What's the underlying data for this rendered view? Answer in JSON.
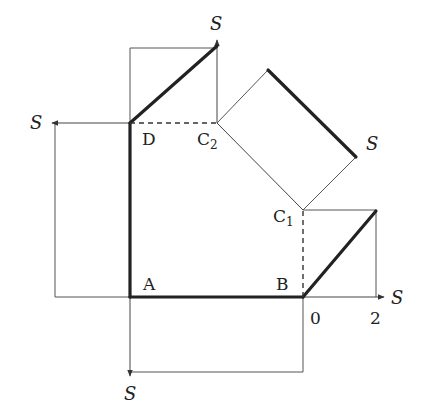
{
  "diagram": {
    "type": "shear-force-projection-diagram",
    "points": {
      "A": {
        "label": "A",
        "x": 130,
        "y": 297
      },
      "B": {
        "label": "B",
        "x": 303,
        "y": 297
      },
      "C1": {
        "label": "C",
        "sub": "1",
        "x": 303,
        "y": 210
      },
      "C2": {
        "label": "C",
        "sub": "2",
        "x": 217,
        "y": 123
      },
      "D": {
        "label": "D",
        "x": 130,
        "y": 123
      }
    },
    "axis_labels": {
      "top": "S",
      "left": "S",
      "right": "S",
      "diagonal": "S",
      "bottom": "S"
    },
    "ticks": {
      "zero": "0",
      "two": "2"
    },
    "colors": {
      "thick_line": "#222222",
      "thin_line": "#555555",
      "background": "#ffffff"
    }
  }
}
